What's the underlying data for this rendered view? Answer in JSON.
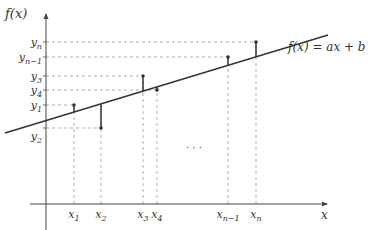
{
  "diagram": {
    "type": "linear-regression-residuals",
    "y_axis_label": "f(x)",
    "x_axis_label": "x",
    "line_label": "f(x) = ax + b",
    "ellipsis": "· · ·",
    "x_ticks": [
      {
        "base": "x",
        "sub": "1",
        "px": 74
      },
      {
        "base": "x",
        "sub": "2",
        "px": 101
      },
      {
        "base": "x",
        "sub": "3",
        "px": 143
      },
      {
        "base": "x",
        "sub": "4",
        "px": 157
      },
      {
        "base": "x",
        "sub": "n−1",
        "px": 228
      },
      {
        "base": "x",
        "sub": "n",
        "px": 256
      }
    ],
    "y_ticks": [
      {
        "base": "y",
        "sub": "n",
        "py": 42
      },
      {
        "base": "y",
        "sub": "n−1",
        "py": 57
      },
      {
        "base": "y",
        "sub": "3",
        "py": 76
      },
      {
        "base": "y",
        "sub": "4",
        "py": 90
      },
      {
        "base": "y",
        "sub": "1",
        "py": 105
      },
      {
        "base": "y",
        "sub": "2",
        "py": 128
      }
    ],
    "points": [
      {
        "name": "(x1, y1)",
        "px": 74,
        "py": 105
      },
      {
        "name": "(x2, y2)",
        "px": 101,
        "py": 128
      },
      {
        "name": "(x3, y3)",
        "px": 143,
        "py": 76
      },
      {
        "name": "(x4, y4)",
        "px": 157,
        "py": 90
      },
      {
        "name": "(xn-1, yn-1)",
        "px": 228,
        "py": 57
      },
      {
        "name": "(xn, yn)",
        "px": 256,
        "py": 42
      }
    ],
    "colors": {
      "axis": "#444444",
      "line": "#333333",
      "guide": "#999999",
      "text": "#333333"
    }
  }
}
